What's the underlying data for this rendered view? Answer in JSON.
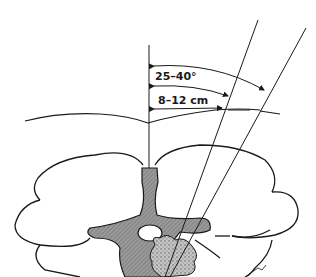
{
  "diagram": {
    "labels": {
      "angle": "25–40°",
      "distance": "8–12 cm"
    },
    "elements": [
      {
        "name": "skin-surface-line",
        "label": "skin surface"
      },
      {
        "name": "midline",
        "label": "midline"
      },
      {
        "name": "needle-paths",
        "count": 2
      },
      {
        "name": "vertebra",
        "label": "vertebral body and spinous process"
      },
      {
        "name": "spinal-canal",
        "label": "spinal canal"
      },
      {
        "name": "lesion",
        "label": "lesion (stippled)"
      },
      {
        "name": "lungs",
        "label": "lungs / surrounding tissue"
      }
    ],
    "colors": {
      "line": "#1a1a1a",
      "bone_fill": "#8a8a8a",
      "lesion_fill": "#b0b0b0",
      "background": "#ffffff"
    },
    "signature": "illustrator signature"
  }
}
